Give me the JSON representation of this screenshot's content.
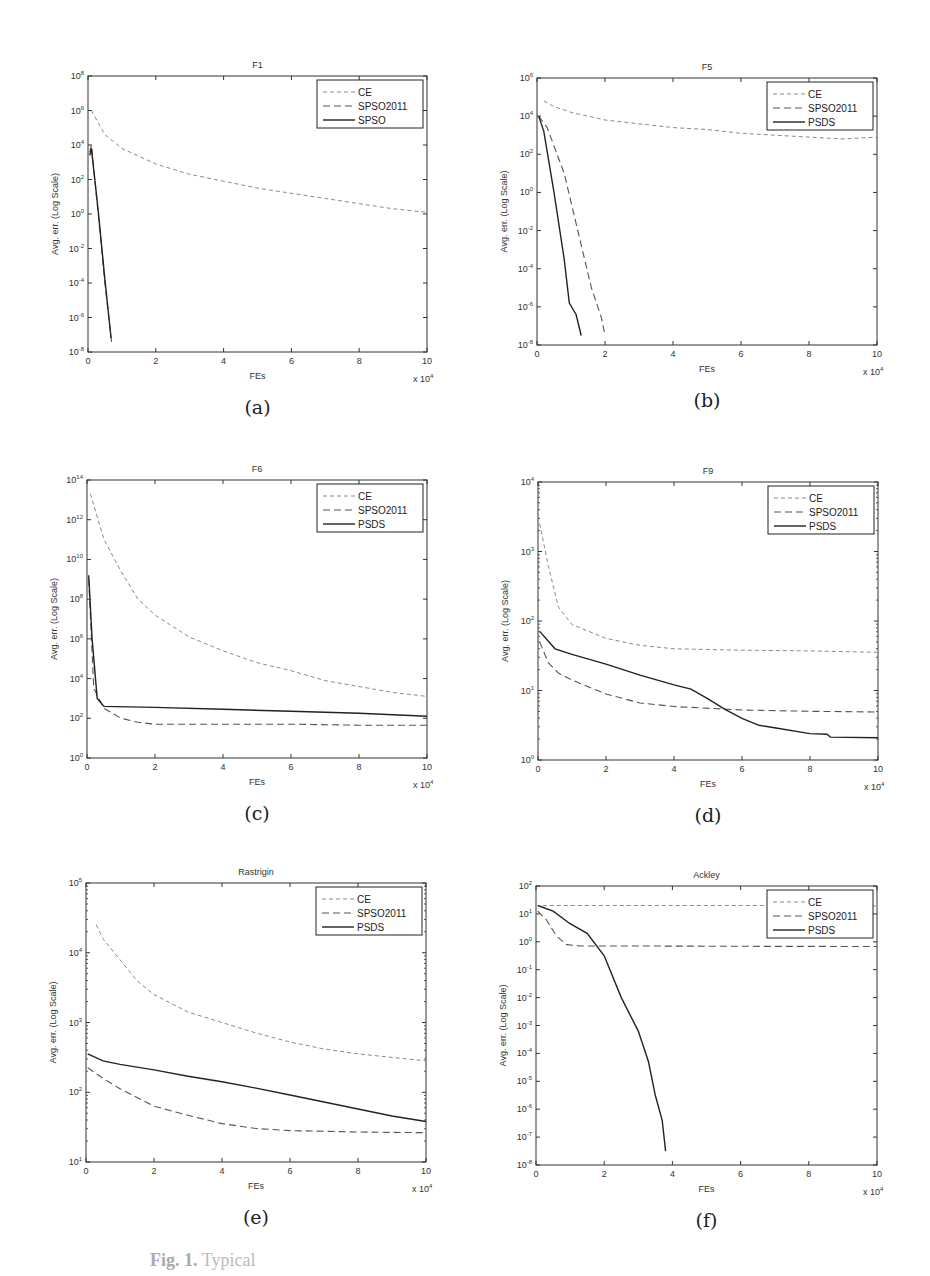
{
  "figure": {
    "caption_prefix": "Fig. 1.",
    "caption_text": "Typical"
  },
  "chart_data": [
    {
      "id": "a",
      "sublabel": "(a)",
      "type": "line",
      "title": "F1",
      "xlabel": "FEs",
      "xscale_note": "x 10^4",
      "ylabel": "Avg. err. (Log Scale)",
      "yscale": "log",
      "ylim_exp": [
        -8,
        8
      ],
      "yticks_exp": [
        -8,
        -6,
        -4,
        -2,
        0,
        2,
        4,
        6,
        8
      ],
      "xlim": [
        0,
        10
      ],
      "xticks": [
        0,
        2,
        4,
        6,
        8,
        10
      ],
      "legend": [
        "CE",
        "SPSO2011",
        "SPSO"
      ],
      "box": [
        88,
        76,
        339,
        276
      ],
      "series": [
        {
          "name": "CE",
          "style": "dash-light",
          "points": [
            [
              0.1,
              6
            ],
            [
              0.5,
              4.6
            ],
            [
              1,
              3.8
            ],
            [
              2,
              2.9
            ],
            [
              3,
              2.3
            ],
            [
              4,
              1.9
            ],
            [
              5,
              1.5
            ],
            [
              6,
              1.2
            ],
            [
              7,
              0.9
            ],
            [
              8,
              0.6
            ],
            [
              9,
              0.3
            ],
            [
              10,
              0.1
            ]
          ]
        },
        {
          "name": "SPSO2011",
          "style": "dash-dark",
          "points": [
            [
              0.05,
              3.6
            ],
            [
              0.1,
              4
            ],
            [
              0.3,
              0
            ],
            [
              0.5,
              -4
            ],
            [
              0.7,
              -7.5
            ]
          ]
        },
        {
          "name": "SPSO",
          "style": "solid",
          "points": [
            [
              0.05,
              3.4
            ],
            [
              0.1,
              3.8
            ],
            [
              0.3,
              0.2
            ],
            [
              0.5,
              -3.8
            ],
            [
              0.68,
              -7.2
            ]
          ]
        }
      ]
    },
    {
      "id": "b",
      "sublabel": "(b)",
      "type": "line",
      "title": "F5",
      "xlabel": "FEs",
      "xscale_note": "x 10^4",
      "ylabel": "Avg. err. (Log Scale)",
      "yscale": "log",
      "ylim_exp": [
        -8,
        6
      ],
      "yticks_exp": [
        -8,
        -6,
        -4,
        -2,
        0,
        2,
        4,
        6
      ],
      "xlim": [
        0,
        10
      ],
      "xticks": [
        0,
        2,
        4,
        6,
        8,
        10
      ],
      "legend": [
        "CE",
        "SPSO2011",
        "PSDS"
      ],
      "box": [
        537,
        78,
        340,
        267
      ],
      "series": [
        {
          "name": "CE",
          "style": "dash-light",
          "points": [
            [
              0.2,
              4.8
            ],
            [
              0.5,
              4.5
            ],
            [
              1,
              4.2
            ],
            [
              2,
              3.8
            ],
            [
              3,
              3.6
            ],
            [
              4,
              3.4
            ],
            [
              5,
              3.3
            ],
            [
              6,
              3.1
            ],
            [
              7,
              3.0
            ],
            [
              8,
              2.9
            ],
            [
              9,
              2.8
            ],
            [
              10,
              2.9
            ]
          ]
        },
        {
          "name": "SPSO2011",
          "style": "dash-dark",
          "points": [
            [
              0.05,
              4
            ],
            [
              0.3,
              3.4
            ],
            [
              0.8,
              1
            ],
            [
              1.2,
              -2
            ],
            [
              1.6,
              -5
            ],
            [
              1.9,
              -6.6
            ],
            [
              2,
              -7.5
            ]
          ]
        },
        {
          "name": "PSDS",
          "style": "solid",
          "points": [
            [
              0.05,
              4
            ],
            [
              0.2,
              3.2
            ],
            [
              0.5,
              0
            ],
            [
              0.8,
              -3.5
            ],
            [
              0.95,
              -5.8
            ],
            [
              1.15,
              -6.4
            ],
            [
              1.3,
              -7.5
            ]
          ]
        }
      ]
    },
    {
      "id": "c",
      "sublabel": "(c)",
      "type": "line",
      "title": "F6",
      "xlabel": "FEs",
      "xscale_note": "x 10^4",
      "ylabel": "Avg. err. (Log Scale)",
      "yscale": "log",
      "ylim_exp": [
        0,
        14
      ],
      "yticks_exp": [
        0,
        2,
        4,
        6,
        8,
        10,
        12,
        14
      ],
      "xlim": [
        0,
        10
      ],
      "xticks": [
        0,
        2,
        4,
        6,
        8,
        10
      ],
      "legend": [
        "CE",
        "SPSO2011",
        "PSDS"
      ],
      "box": [
        87,
        480,
        340,
        278
      ],
      "series": [
        {
          "name": "CE",
          "style": "dash-light",
          "points": [
            [
              0.1,
              13.3
            ],
            [
              0.5,
              11
            ],
            [
              1,
              9.4
            ],
            [
              1.5,
              8.0
            ],
            [
              2,
              7.2
            ],
            [
              3,
              6.1
            ],
            [
              4,
              5.4
            ],
            [
              5,
              4.8
            ],
            [
              6,
              4.4
            ],
            [
              7,
              3.9
            ],
            [
              8,
              3.6
            ],
            [
              9,
              3.3
            ],
            [
              10,
              3.1
            ]
          ]
        },
        {
          "name": "SPSO2011",
          "style": "dash-dark",
          "points": [
            [
              0.05,
              9
            ],
            [
              0.2,
              3.5
            ],
            [
              0.5,
              2.5
            ],
            [
              1,
              2.0
            ],
            [
              1.5,
              1.8
            ],
            [
              2,
              1.7
            ],
            [
              4,
              1.7
            ],
            [
              6,
              1.7
            ],
            [
              8,
              1.65
            ],
            [
              10,
              1.65
            ]
          ]
        },
        {
          "name": "PSDS",
          "style": "solid",
          "points": [
            [
              0.05,
              9.2
            ],
            [
              0.15,
              6
            ],
            [
              0.3,
              3
            ],
            [
              0.5,
              2.6
            ],
            [
              2,
              2.55
            ],
            [
              4,
              2.45
            ],
            [
              6,
              2.35
            ],
            [
              8,
              2.25
            ],
            [
              10,
              2.1
            ]
          ]
        }
      ]
    },
    {
      "id": "d",
      "sublabel": "(d)",
      "type": "line",
      "title": "F9",
      "xlabel": "FEs",
      "xscale_note": "x 10^4",
      "ylabel": "Avg. err. (Log Scale)",
      "yscale": "log",
      "ylim_exp": [
        0,
        4
      ],
      "yticks_exp": [
        0,
        1,
        2,
        3,
        4
      ],
      "xlim": [
        0,
        10
      ],
      "xticks": [
        0,
        2,
        4,
        6,
        8,
        10
      ],
      "legend": [
        "CE",
        "SPSO2011",
        "PSDS"
      ],
      "box": [
        538,
        482,
        340,
        278
      ],
      "series": [
        {
          "name": "CE",
          "style": "dash-light",
          "points": [
            [
              0.05,
              3.4
            ],
            [
              0.3,
              2.8
            ],
            [
              0.6,
              2.2
            ],
            [
              1,
              1.95
            ],
            [
              2,
              1.75
            ],
            [
              3,
              1.65
            ],
            [
              4,
              1.6
            ],
            [
              6,
              1.58
            ],
            [
              8,
              1.57
            ],
            [
              10,
              1.55
            ]
          ]
        },
        {
          "name": "SPSO2011",
          "style": "dash-dark",
          "points": [
            [
              0.05,
              1.7
            ],
            [
              0.3,
              1.4
            ],
            [
              0.6,
              1.25
            ],
            [
              1,
              1.15
            ],
            [
              2,
              0.95
            ],
            [
              3,
              0.82
            ],
            [
              4,
              0.77
            ],
            [
              6,
              0.72
            ],
            [
              8,
              0.7
            ],
            [
              10,
              0.69
            ]
          ]
        },
        {
          "name": "PSDS",
          "style": "solid",
          "points": [
            [
              0.05,
              1.85
            ],
            [
              0.5,
              1.6
            ],
            [
              1,
              1.52
            ],
            [
              2,
              1.38
            ],
            [
              3,
              1.22
            ],
            [
              4,
              1.08
            ],
            [
              4.5,
              1.02
            ],
            [
              5,
              0.88
            ],
            [
              5.5,
              0.73
            ],
            [
              6,
              0.6
            ],
            [
              6.5,
              0.5
            ],
            [
              7,
              0.46
            ],
            [
              8,
              0.38
            ],
            [
              8.5,
              0.37
            ],
            [
              8.6,
              0.33
            ],
            [
              10,
              0.32
            ]
          ]
        }
      ]
    },
    {
      "id": "e",
      "sublabel": "(e)",
      "type": "line",
      "title": "Rastrigin",
      "xlabel": "FEs",
      "xscale_note": "x 10^4",
      "ylabel": "Avg. err. (Log Scale)",
      "yscale": "log",
      "ylim_exp": [
        1,
        5
      ],
      "yticks_exp": [
        1,
        2,
        3,
        4,
        5
      ],
      "xlim": [
        0,
        10
      ],
      "xticks": [
        0,
        2,
        4,
        6,
        8,
        10
      ],
      "legend": [
        "CE",
        "SPSO2011",
        "PSDS"
      ],
      "box": [
        86,
        883,
        340,
        279
      ],
      "series": [
        {
          "name": "CE",
          "style": "dash-light",
          "points": [
            [
              0.3,
              4.4
            ],
            [
              0.5,
              4.2
            ],
            [
              1,
              3.9
            ],
            [
              1.5,
              3.6
            ],
            [
              2,
              3.4
            ],
            [
              3,
              3.15
            ],
            [
              4,
              3.0
            ],
            [
              5,
              2.85
            ],
            [
              6,
              2.72
            ],
            [
              7,
              2.62
            ],
            [
              8,
              2.55
            ],
            [
              9,
              2.5
            ],
            [
              10,
              2.45
            ]
          ]
        },
        {
          "name": "SPSO2011",
          "style": "dash-dark",
          "points": [
            [
              0.05,
              2.35
            ],
            [
              0.5,
              2.2
            ],
            [
              1,
              2.05
            ],
            [
              2,
              1.8
            ],
            [
              3,
              1.67
            ],
            [
              4,
              1.55
            ],
            [
              5,
              1.48
            ],
            [
              6,
              1.45
            ],
            [
              8,
              1.43
            ],
            [
              10,
              1.42
            ]
          ]
        },
        {
          "name": "PSDS",
          "style": "solid",
          "points": [
            [
              0.05,
              2.55
            ],
            [
              0.5,
              2.45
            ],
            [
              1,
              2.4
            ],
            [
              2,
              2.32
            ],
            [
              3,
              2.23
            ],
            [
              4,
              2.15
            ],
            [
              5,
              2.06
            ],
            [
              6,
              1.96
            ],
            [
              7,
              1.86
            ],
            [
              8,
              1.76
            ],
            [
              9,
              1.66
            ],
            [
              10,
              1.58
            ]
          ]
        }
      ]
    },
    {
      "id": "f",
      "sublabel": "(f)",
      "type": "line",
      "title": "Ackley",
      "xlabel": "FEs",
      "xscale_note": "x 10^4",
      "ylabel": "Avg. err. (Log Scale)",
      "yscale": "log",
      "ylim_exp": [
        -8,
        2
      ],
      "yticks_exp": [
        -8,
        -6,
        -4,
        -2,
        -1,
        0,
        1,
        2
      ],
      "ytick_labels": [
        "10^-8",
        "10^-6",
        "10^-4",
        "10^-3",
        "10^-2",
        "10^-1",
        "10^0",
        "10^1",
        "10^2"
      ],
      "xlim": [
        0,
        10
      ],
      "xticks": [
        0,
        2,
        4,
        6,
        8,
        10
      ],
      "legend": [
        "CE",
        "SPSO2011",
        "PSDS"
      ],
      "box": [
        536,
        886,
        341,
        279
      ],
      "series": [
        {
          "name": "CE",
          "style": "dash-light",
          "points": [
            [
              0.2,
              1.3
            ],
            [
              2,
              1.3
            ],
            [
              4,
              1.3
            ],
            [
              6,
              1.3
            ],
            [
              8,
              1.3
            ],
            [
              10,
              1.28
            ]
          ]
        },
        {
          "name": "SPSO2011",
          "style": "dash-dark",
          "points": [
            [
              0.05,
              1.1
            ],
            [
              0.3,
              0.8
            ],
            [
              0.6,
              0.2
            ],
            [
              0.9,
              -0.1
            ],
            [
              1.3,
              -0.15
            ],
            [
              3,
              -0.15
            ],
            [
              6,
              -0.16
            ],
            [
              10,
              -0.17
            ]
          ]
        },
        {
          "name": "PSDS",
          "style": "solid",
          "points": [
            [
              0.05,
              1.3
            ],
            [
              0.5,
              1.1
            ],
            [
              1,
              0.65
            ],
            [
              1.5,
              0.3
            ],
            [
              2,
              -0.5
            ],
            [
              2.5,
              -2
            ],
            [
              3,
              -3.2
            ],
            [
              3.3,
              -4.3
            ],
            [
              3.5,
              -5.5
            ],
            [
              3.7,
              -6.4
            ],
            [
              3.8,
              -7.5
            ]
          ]
        }
      ]
    }
  ]
}
